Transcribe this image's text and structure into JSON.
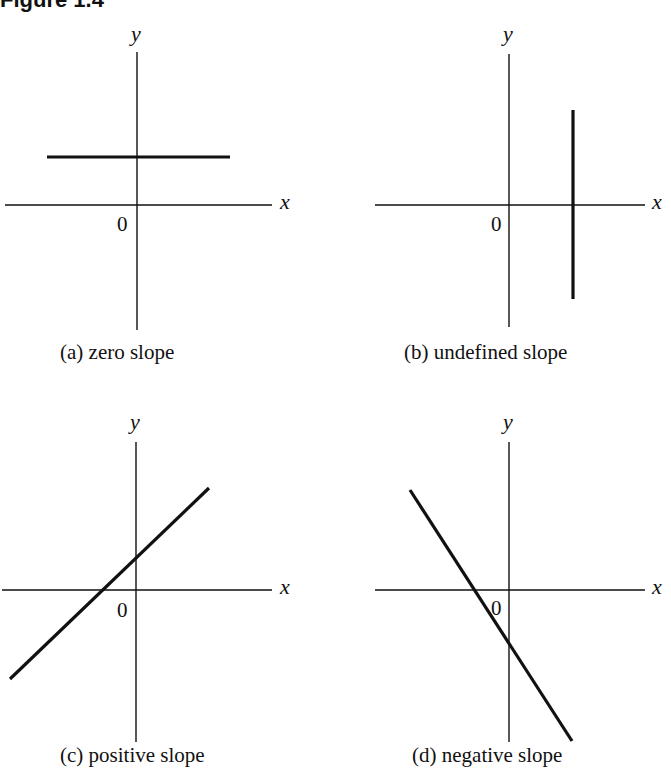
{
  "figure": {
    "title": "Figure 1.4"
  },
  "panels": [
    {
      "id": "a",
      "caption": "(a)  zero slope",
      "x_label": "x",
      "y_label": "y",
      "origin_label": "0",
      "line_type": "horizontal"
    },
    {
      "id": "b",
      "caption": "(b)  undefined slope",
      "x_label": "x",
      "y_label": "y",
      "origin_label": "0",
      "line_type": "vertical"
    },
    {
      "id": "c",
      "caption": "(c)  positive slope",
      "x_label": "x",
      "y_label": "y",
      "origin_label": "0",
      "line_type": "positive"
    },
    {
      "id": "d",
      "caption": "(d)  negative slope",
      "x_label": "x",
      "y_label": "y",
      "origin_label": "0",
      "line_type": "negative"
    }
  ],
  "colors": {
    "ink": "#111111",
    "background": "#ffffff"
  }
}
